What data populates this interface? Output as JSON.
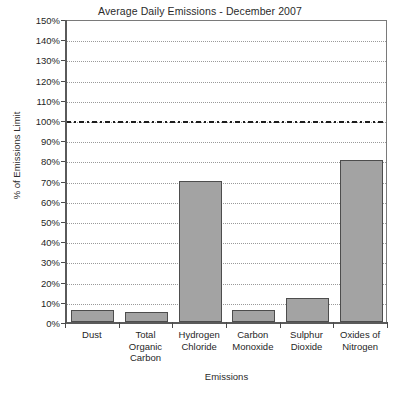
{
  "chart_data": {
    "type": "bar",
    "title": "Average Daily Emissions - December 2007",
    "xlabel": "Emissions",
    "ylabel": "% of Emissions Limit",
    "categories": [
      "Dust",
      "Total Organic Carbon",
      "Hydrogen Chloride",
      "Carbon Monoxide",
      "Sulphur Dioxide",
      "Oxides of Nitrogen"
    ],
    "category_label_lines": [
      [
        "Dust"
      ],
      [
        "Total",
        "Organic",
        "Carbon"
      ],
      [
        "Hydrogen",
        "Chloride"
      ],
      [
        "Carbon",
        "Monoxide"
      ],
      [
        "Sulphur",
        "Dioxide"
      ],
      [
        "Oxides of",
        "Nitrogen"
      ]
    ],
    "values": [
      6,
      5,
      70,
      6,
      12,
      80
    ],
    "value_unit": "%",
    "ylim": [
      0,
      150
    ],
    "ytick_step": 10,
    "ytick_labels": [
      "0%",
      "10%",
      "20%",
      "30%",
      "40%",
      "50%",
      "60%",
      "70%",
      "80%",
      "90%",
      "100%",
      "110%",
      "120%",
      "130%",
      "140%",
      "150%"
    ],
    "grid": true,
    "legend": false,
    "reference_lines": [
      {
        "name": "emissions-limit",
        "value": 100,
        "label": "100%",
        "style": "dash-dot"
      }
    ],
    "colors": {
      "bar_fill": "#a3a3a3",
      "bar_border": "#4d4d4d",
      "gridline": "#9a9a9a",
      "axis": "#5a5a5a",
      "limit_line": "#1d1d1d",
      "text": "#1f1f1f",
      "background": "#ffffff"
    }
  }
}
